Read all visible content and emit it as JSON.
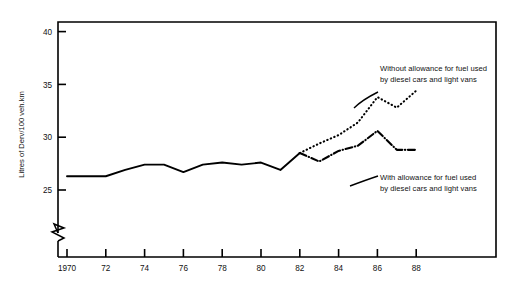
{
  "chart_data": {
    "type": "line",
    "title": "",
    "xlabel": "",
    "ylabel": "Litres of Derv/100 veh.km",
    "xlim": [
      1970,
      1989.1
    ],
    "ylim": [
      23.6,
      41.7
    ],
    "y_axis_break": true,
    "y_break_note": "axis broken below 25",
    "grid": false,
    "legend": "annotations-inline",
    "xticks": [
      1970,
      1972,
      1974,
      1976,
      1978,
      1980,
      1982,
      1984,
      1986,
      1988
    ],
    "xticklabels": [
      "1970",
      "72",
      "74",
      "76",
      "78",
      "80",
      "82",
      "84",
      "86",
      "88"
    ],
    "yticks": [
      25,
      30,
      35,
      40
    ],
    "yticklabels": [
      "25",
      "30",
      "35",
      "40"
    ],
    "series": [
      {
        "name": "Combined series (all vehicles)",
        "style": "solid",
        "x": [
          1970,
          1971,
          1972,
          1973,
          1974,
          1975,
          1976,
          1977,
          1978,
          1979,
          1980,
          1981,
          1982
        ],
        "values": [
          26.3,
          26.3,
          26.3,
          26.9,
          27.4,
          27.4,
          26.7,
          27.4,
          27.6,
          27.4,
          27.6,
          26.9,
          28.5
        ]
      },
      {
        "name": "Without allowance for fuel used by diesel cars and light vans",
        "style": "dotted",
        "x": [
          1982,
          1983,
          1984,
          1985,
          1986,
          1987,
          1988
        ],
        "values": [
          28.5,
          29.4,
          30.2,
          31.4,
          33.8,
          32.8,
          34.4
        ]
      },
      {
        "name": "With allowance for fuel used by diesel cars and light vans",
        "style": "dash-dot",
        "x": [
          1982,
          1983,
          1984,
          1985,
          1986,
          1987,
          1988
        ],
        "values": [
          28.5,
          27.7,
          28.7,
          29.2,
          30.6,
          28.8,
          28.8
        ]
      }
    ],
    "annotations": [
      {
        "id": "without",
        "lines": [
          "Without allowance for fuel used",
          "by diesel cars and light vans"
        ],
        "target_series": "Without allowance for fuel used by diesel cars and light vans"
      },
      {
        "id": "with",
        "lines": [
          "With allowance for fuel used",
          "by diesel cars and light vans"
        ],
        "target_series": "With allowance for fuel used by diesel cars and light vans"
      }
    ],
    "colors": {
      "line": "#000000",
      "axis": "#000000",
      "background": "#ffffff",
      "text": "#111111"
    }
  }
}
